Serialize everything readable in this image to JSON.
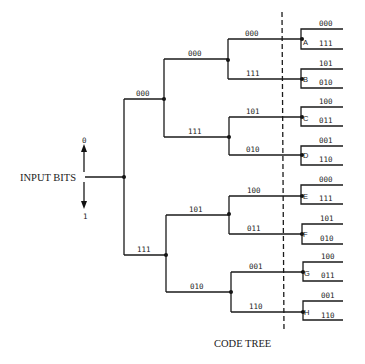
{
  "diagram": {
    "caption": "CODE TREE",
    "input_label": "INPUT BITS",
    "input_up_label": "0",
    "input_down_label": "1",
    "level1": {
      "upper_label": "000",
      "lower_label": "111"
    },
    "level2": {
      "upper": {
        "upper_label": "000",
        "lower_label": "111"
      },
      "lower": {
        "upper_label": "101",
        "lower_label": "010"
      }
    },
    "level3": [
      {
        "upper_label": "000",
        "lower_label": "111"
      },
      {
        "upper_label": "101",
        "lower_label": "010"
      },
      {
        "upper_label": "100",
        "lower_label": "011"
      },
      {
        "upper_label": "001",
        "lower_label": "110"
      }
    ],
    "leaves": [
      {
        "node": "A",
        "upper": "000",
        "lower": "111"
      },
      {
        "node": "B",
        "upper": "101",
        "lower": "010"
      },
      {
        "node": "C",
        "upper": "100",
        "lower": "011"
      },
      {
        "node": "D",
        "upper": "001",
        "lower": "110"
      },
      {
        "node": "E",
        "upper": "000",
        "lower": "111"
      },
      {
        "node": "F",
        "upper": "101",
        "lower": "010"
      },
      {
        "node": "G",
        "upper": "100",
        "lower": "011"
      },
      {
        "node": "H",
        "upper": "001",
        "lower": "110"
      }
    ]
  }
}
